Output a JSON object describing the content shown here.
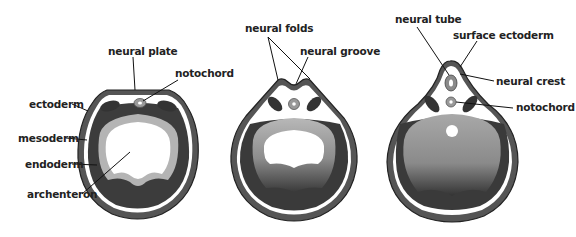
{
  "figure": {
    "panels": [
      {
        "stage": "neural plate stage",
        "labels": {
          "neural_plate": "neural plate",
          "notochord": "notochord",
          "ectoderm": "ectoderm",
          "mesoderm": "mesoderm",
          "endoderm": "endoderm",
          "archenteron": "archenteron"
        }
      },
      {
        "stage": "neural groove stage",
        "labels": {
          "neural_folds": "neural folds",
          "neural_groove": "neural groove"
        }
      },
      {
        "stage": "neural tube stage",
        "labels": {
          "neural_tube": "neural tube",
          "surface_ectoderm": "surface ectoderm",
          "neural_crest": "neural crest",
          "notochord": "notochord"
        }
      }
    ],
    "colors": {
      "ectoderm": "#4a4a4a",
      "mesoderm": "#3a3a3a",
      "endoderm_light": "#bdbdbd",
      "endoderm_dark": "#2e2e2e",
      "background": "#ffffff",
      "label_text": "#222222"
    }
  }
}
